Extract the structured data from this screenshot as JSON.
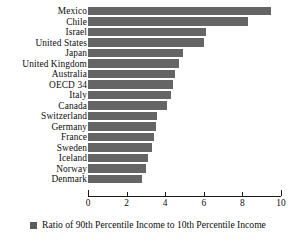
{
  "chart_data": {
    "type": "bar",
    "orientation": "horizontal",
    "title": "",
    "xlabel": "",
    "ylabel": "",
    "xlim": [
      0,
      10
    ],
    "xticks": [
      0,
      2,
      4,
      6,
      8,
      10
    ],
    "grid": false,
    "legend_position": "bottom",
    "series": [
      {
        "name": "Ratio of 90th Percentile Income to 10th Percentile Income",
        "color": "#656565",
        "values": [
          9.5,
          8.3,
          6.1,
          6.0,
          4.9,
          4.7,
          4.5,
          4.4,
          4.3,
          4.1,
          3.6,
          3.5,
          3.4,
          3.3,
          3.1,
          3.0,
          2.8
        ]
      }
    ],
    "categories": [
      "Mexico",
      "Chile",
      "Israel",
      "United States",
      "Japan",
      "United Kingdom",
      "Australia",
      "OECD 34",
      "Italy",
      "Canada",
      "Switzerland",
      "Germany",
      "France",
      "Sweden",
      "Iceland",
      "Norway",
      "Denmark"
    ]
  },
  "legend": {
    "label": "Ratio of 90th Percentile Income to 10th Percentile Income",
    "swatch_color": "#5c5c5c"
  },
  "axis": {
    "tick_labels": [
      "0",
      "2",
      "4",
      "6",
      "8",
      "10"
    ]
  }
}
